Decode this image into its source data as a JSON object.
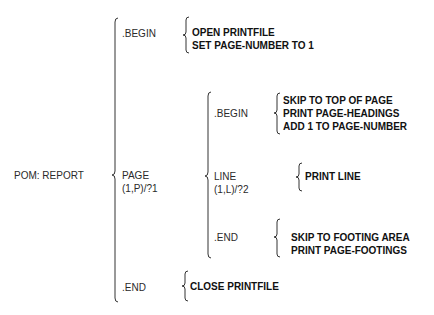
{
  "diagram": {
    "type": "warnier-orr",
    "root": {
      "label": "POM: REPORT"
    },
    "level1": {
      "begin": {
        "label": ".BEGIN",
        "actions": [
          "OPEN PRINTFILE",
          "SET PAGE-NUMBER TO 1"
        ]
      },
      "page": {
        "label": "PAGE",
        "repetition": "(1,P)/?1"
      },
      "end": {
        "label": ".END",
        "actions": [
          "CLOSE PRINTFILE"
        ]
      }
    },
    "level2": {
      "begin": {
        "label": ".BEGIN",
        "actions": [
          "SKIP TO TOP OF PAGE",
          "PRINT PAGE-HEADINGS",
          "ADD 1 TO PAGE-NUMBER"
        ]
      },
      "line": {
        "label": "LINE",
        "repetition": "(1,L)/?2",
        "actions": [
          "PRINT LINE"
        ]
      },
      "end": {
        "label": ".END",
        "actions": [
          "SKIP TO FOOTING AREA",
          "PRINT PAGE-FOOTINGS"
        ]
      }
    }
  }
}
